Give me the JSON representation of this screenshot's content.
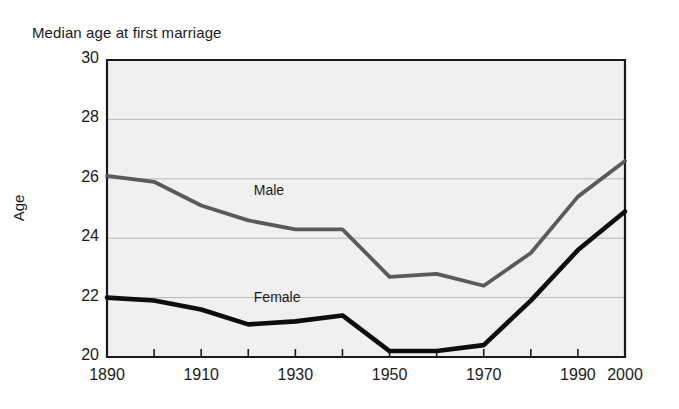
{
  "chart_data": {
    "type": "line",
    "title": "Median age at first marriage",
    "xlabel": "",
    "ylabel": "Age",
    "xlim": [
      1890,
      2000
    ],
    "ylim": [
      20,
      30
    ],
    "ytick_values": [
      30,
      28,
      26,
      24,
      22,
      20
    ],
    "ytick_labels": [
      "30",
      "28",
      "26",
      "24",
      "22",
      "20"
    ],
    "xtick_values": [
      1890,
      1900,
      1910,
      1920,
      1930,
      1940,
      1950,
      1960,
      1970,
      1980,
      1990,
      2000
    ],
    "xtick_labels": [
      "1890",
      "",
      "1910",
      "",
      "1930",
      "",
      "1950",
      "",
      "1970",
      "",
      "1990",
      "2000"
    ],
    "grid": "horizontal",
    "gridlines": [
      28,
      26,
      24,
      22
    ],
    "legend_position": "inline-annotation",
    "x": [
      1890,
      1900,
      1910,
      1920,
      1930,
      1940,
      1950,
      1960,
      1970,
      1980,
      1990,
      2000
    ],
    "series": [
      {
        "name": "Male",
        "color": "#5a5a5a",
        "values": [
          26.1,
          25.9,
          25.1,
          24.6,
          24.3,
          24.3,
          22.7,
          22.8,
          22.4,
          23.5,
          25.4,
          26.6
        ]
      },
      {
        "name": "Female",
        "color": "#0d0d0d",
        "values": [
          22.0,
          21.9,
          21.6,
          21.1,
          21.2,
          21.4,
          20.2,
          20.2,
          20.4,
          21.9,
          23.6,
          24.9
        ]
      }
    ],
    "annotations": [
      {
        "label": "Male",
        "x": 1925,
        "y": 25.6
      },
      {
        "label": "Female",
        "x": 1925,
        "y": 22.0
      }
    ],
    "colors": {
      "plot_background": "#f0f0f0",
      "axis": "#1a1a1a",
      "gridline": "#b9b9b9",
      "text": "#1a1a1a"
    }
  }
}
